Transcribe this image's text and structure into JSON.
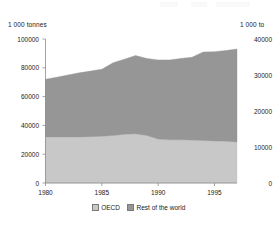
{
  "chart_data": {
    "type": "area",
    "stacked": true,
    "title": "",
    "subtitle": "",
    "xlabel": "",
    "ylabel": "1 000 tonnes",
    "y2label": "1 000 to",
    "x": [
      1980,
      1981,
      1982,
      1983,
      1984,
      1985,
      1986,
      1987,
      1988,
      1989,
      1990,
      1991,
      1992,
      1993,
      1994,
      1995,
      1996,
      1997
    ],
    "xlim": [
      1980,
      1997
    ],
    "xticks": [
      1980,
      1985,
      1990,
      1995
    ],
    "xtick_labels": [
      "1980",
      "1985",
      "1990",
      "1995"
    ],
    "ylim": [
      0,
      100000
    ],
    "yticks": [
      0,
      20000,
      40000,
      60000,
      80000,
      100000
    ],
    "ytick_labels": [
      "0",
      "20000",
      "40000",
      "60000",
      "80000",
      "100000"
    ],
    "y2lim": [
      0,
      40000
    ],
    "y2ticks": [
      0,
      10000,
      20000,
      30000,
      40000
    ],
    "y2tick_labels": [
      "0",
      "10000",
      "20000",
      "30000",
      "40000"
    ],
    "grid": false,
    "legend_position": "bottom",
    "series": [
      {
        "name": "OECD",
        "color": "#c8c8c8",
        "values": [
          32000,
          32000,
          32000,
          32000,
          32200,
          32500,
          33000,
          33800,
          34200,
          33000,
          30500,
          30000,
          30000,
          29800,
          29500,
          29200,
          29000,
          28500
        ]
      },
      {
        "name": "Rest of the world",
        "color": "#969696",
        "values": [
          40000,
          41500,
          43000,
          44500,
          45500,
          46500,
          50500,
          52200,
          54300,
          53500,
          55000,
          55500,
          56500,
          57500,
          61500,
          62000,
          63000,
          64500
        ]
      }
    ],
    "totals": [
      72000,
      73500,
      75000,
      76500,
      77700,
      79000,
      83500,
      86000,
      88500,
      86500,
      85500,
      85500,
      86500,
      87300,
      91000,
      91200,
      92000,
      93000
    ]
  },
  "axes": {
    "left_unit": "1 000 tonnes",
    "right_unit": "1 000 to"
  },
  "legend": {
    "items": [
      {
        "label": "OECD",
        "color": "#c8c8c8"
      },
      {
        "label": "Rest of the world",
        "color": "#969696"
      }
    ]
  }
}
